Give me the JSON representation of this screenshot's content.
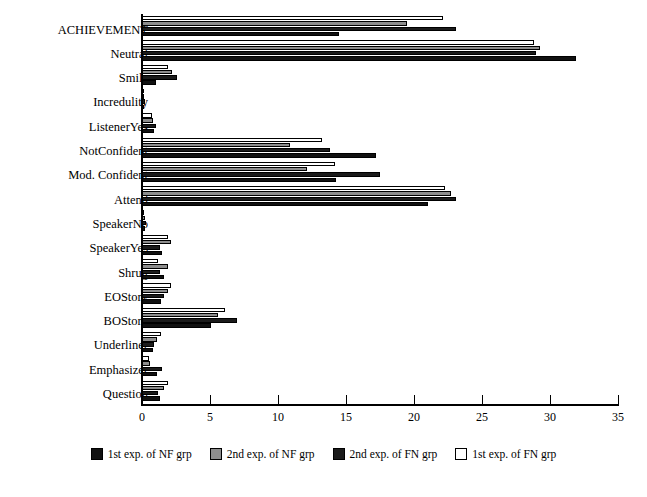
{
  "chart_data": {
    "type": "bar",
    "orientation": "horizontal",
    "title": "",
    "xlabel": "",
    "ylabel": "",
    "xlim": [
      0,
      35
    ],
    "xticks": [
      0,
      5,
      10,
      15,
      20,
      25,
      30,
      35
    ],
    "xtick_labels": [
      "0",
      "5",
      "10",
      "15",
      "20",
      "25",
      "30",
      "35"
    ],
    "grid": false,
    "legend_position": "bottom",
    "categories": [
      "ACHIEVEMENT",
      "Neutral",
      "Smile",
      "Incredulity",
      "ListenerYes",
      "NotConfident",
      "Mod. Confident",
      "Attend",
      "SpeakerNo",
      "SpeakerYes",
      "Shrug",
      "EOStory",
      "BOStory",
      "Underliner",
      "Emphasizer",
      "Question"
    ],
    "series": [
      {
        "name": "1st exp. of NF grp",
        "color": "#111111",
        "values": [
          14.5,
          31.9,
          1.0,
          0.15,
          0.9,
          17.2,
          14.3,
          21.0,
          0.25,
          1.5,
          1.6,
          1.4,
          5.1,
          0.8,
          1.1,
          1.3
        ]
      },
      {
        "name": "2nd exp. of NF grp",
        "color": "#8d8d8d",
        "values": [
          19.5,
          29.3,
          2.2,
          0.1,
          0.8,
          10.9,
          12.1,
          22.7,
          0.2,
          2.1,
          1.9,
          1.9,
          5.6,
          1.1,
          0.6,
          1.6
        ]
      },
      {
        "name": "2nd exp. of FN grp",
        "color": "#1b1b1b",
        "values": [
          23.1,
          29.0,
          2.6,
          0.2,
          1.0,
          13.8,
          17.5,
          23.1,
          0.3,
          1.3,
          1.3,
          1.6,
          7.0,
          0.9,
          1.5,
          1.2
        ]
      },
      {
        "name": "1st exp. of FN grp",
        "color": "#ffffff",
        "values": [
          22.1,
          28.8,
          1.9,
          0.1,
          0.7,
          13.2,
          14.2,
          22.3,
          0.15,
          1.9,
          1.2,
          2.1,
          6.1,
          1.4,
          0.5,
          1.9
        ]
      }
    ]
  }
}
